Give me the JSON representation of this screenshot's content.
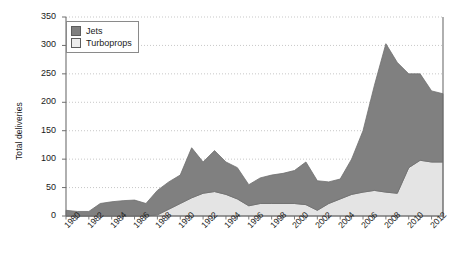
{
  "chart_data": {
    "type": "area",
    "stacked": true,
    "title": "",
    "xlabel": "",
    "ylabel": "Total deliveries",
    "ylim": [
      0,
      350
    ],
    "ytick_step": 50,
    "yticks": [
      0,
      50,
      100,
      150,
      200,
      250,
      300,
      350
    ],
    "grid": "horizontal-dotted",
    "legend_position": "top-left-inside",
    "x": [
      1980,
      1981,
      1982,
      1983,
      1984,
      1985,
      1986,
      1987,
      1988,
      1989,
      1990,
      1991,
      1992,
      1993,
      1994,
      1995,
      1996,
      1997,
      1998,
      1999,
      2000,
      2001,
      2002,
      2003,
      2004,
      2005,
      2006,
      2007,
      2008,
      2009,
      2010,
      2011,
      2012,
      2013
    ],
    "xtick_labels": [
      "1980",
      "1982",
      "1984",
      "1986",
      "1988",
      "1990",
      "1992",
      "1994",
      "1996",
      "1998",
      "2000",
      "2002",
      "2004",
      "2006",
      "2008",
      "2010",
      "2012"
    ],
    "xtick_values": [
      1980,
      1982,
      1984,
      1986,
      1988,
      1990,
      1992,
      1994,
      1996,
      1998,
      2000,
      2002,
      2004,
      2006,
      2008,
      2010,
      2012
    ],
    "series": [
      {
        "name": "Turboprops",
        "color": "#e4e4e4",
        "stack_order": 0,
        "values": [
          0,
          0,
          0,
          0,
          0,
          0,
          0,
          0,
          2,
          12,
          22,
          32,
          40,
          43,
          38,
          30,
          18,
          22,
          22,
          22,
          22,
          20,
          10,
          22,
          30,
          38,
          42,
          45,
          42,
          40,
          85,
          98,
          95,
          95
        ]
      },
      {
        "name": "Jets",
        "color": "#808080",
        "stack_order": 1,
        "values": [
          10,
          8,
          8,
          22,
          25,
          27,
          28,
          22,
          43,
          48,
          50,
          88,
          55,
          72,
          57,
          55,
          37,
          45,
          50,
          53,
          58,
          75,
          52,
          38,
          35,
          62,
          108,
          185,
          261,
          230,
          165,
          152,
          125,
          120
        ]
      }
    ],
    "totals": [
      10,
      8,
      8,
      22,
      25,
      27,
      28,
      22,
      45,
      60,
      72,
      120,
      95,
      115,
      95,
      85,
      55,
      67,
      72,
      75,
      80,
      95,
      62,
      60,
      65,
      100,
      150,
      230,
      303,
      270,
      250,
      250,
      220,
      215
    ]
  },
  "legend": {
    "items": [
      {
        "label": "Jets",
        "color": "#808080"
      },
      {
        "label": "Turboprops",
        "color": "#ededed"
      }
    ]
  },
  "axes": {
    "y_title": "Total deliveries"
  },
  "colors": {
    "jets": "#808080",
    "turboprops": "#e4e4e4",
    "axis": "#6e6e6e",
    "grid": "#b9b9b9",
    "text": "#1a1a1a"
  }
}
